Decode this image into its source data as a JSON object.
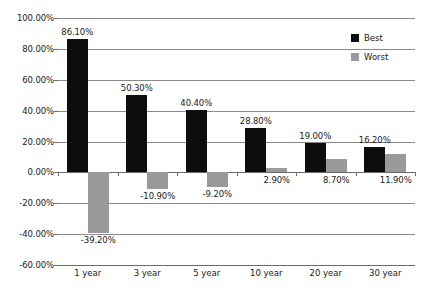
{
  "chart_data": {
    "type": "bar",
    "title": "",
    "subtitle": "",
    "xlabel": "",
    "ylabel": "",
    "categories": [
      "1 year",
      "3 year",
      "5 year",
      "10 year",
      "20 year",
      "30 year"
    ],
    "series": [
      {
        "name": "Best",
        "color": "#0d0d0d",
        "values": [
          86.1,
          50.3,
          40.4,
          28.8,
          19.0,
          16.2
        ],
        "labels": [
          "86.10%",
          "50.30%",
          "40.40%",
          "28.80%",
          "19.00%",
          "16.20%"
        ]
      },
      {
        "name": "Worst",
        "color": "#9a9a9a",
        "values": [
          -39.2,
          -10.9,
          -9.2,
          2.9,
          8.7,
          11.9
        ],
        "labels": [
          "-39.20%",
          "-10.90%",
          "-9.20%",
          "2.90%",
          "8.70%",
          "11.90%"
        ]
      }
    ],
    "ylim": [
      -60,
      100
    ],
    "ytick_values": [
      100,
      80,
      60,
      40,
      20,
      0,
      -20,
      -40,
      -60
    ],
    "ytick_labels": [
      "100.00%",
      "80.00%",
      "60.00%",
      "40.00%",
      "20.00%",
      "0.00%",
      "-20.00%",
      "-40.00%",
      "-60.00%"
    ],
    "grid": true,
    "legend_position": "top-right",
    "legend_entries": [
      "Best",
      "Worst"
    ]
  }
}
